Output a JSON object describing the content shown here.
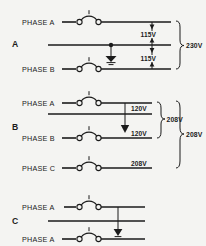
{
  "figure": {
    "background_color": "#f4f4f2",
    "line_color": "#1b1b1b",
    "width": 206,
    "height": 246
  },
  "sections": [
    {
      "id": "A",
      "label": "A",
      "conductors": [
        {
          "name": "phase-a",
          "label": "PHASE A",
          "has_switch": true
        },
        {
          "name": "neutral",
          "label": "",
          "has_switch": false,
          "has_ground": true
        },
        {
          "name": "phase-b",
          "label": "PHASE B",
          "has_switch": true
        }
      ],
      "dimensions": [
        {
          "name": "upper-leg-voltage",
          "label": "115V"
        },
        {
          "name": "lower-leg-voltage",
          "label": "115V"
        }
      ],
      "braces": [
        {
          "name": "total-voltage-brace",
          "label": "230V"
        }
      ]
    },
    {
      "id": "B",
      "label": "B",
      "conductors": [
        {
          "name": "phase-a",
          "label": "PHASE A",
          "has_switch": true
        },
        {
          "name": "neutral",
          "label": "",
          "has_switch": false,
          "has_ground": true
        },
        {
          "name": "phase-b",
          "label": "PHASE B",
          "has_switch": true
        },
        {
          "name": "phase-c",
          "label": "PHASE C",
          "has_switch": true
        }
      ],
      "dimensions": [
        {
          "name": "phase-a-to-neutral-voltage",
          "label": "120V"
        },
        {
          "name": "neutral-to-phase-b-voltage",
          "label": "120V"
        },
        {
          "name": "phase-c-voltage",
          "label": "208V"
        }
      ],
      "braces": [
        {
          "name": "inner-voltage-brace",
          "label": "208V"
        },
        {
          "name": "outer-voltage-brace",
          "label": "208V"
        }
      ]
    },
    {
      "id": "C",
      "label": "C",
      "conductors": [
        {
          "name": "phase-a-upper",
          "label": "PHASE  A",
          "has_switch": true
        },
        {
          "name": "neutral",
          "label": "",
          "has_switch": false,
          "has_ground": true
        },
        {
          "name": "phase-a-lower",
          "label": "PHASE A",
          "has_switch": true
        }
      ],
      "dimensions": [],
      "braces": []
    }
  ]
}
